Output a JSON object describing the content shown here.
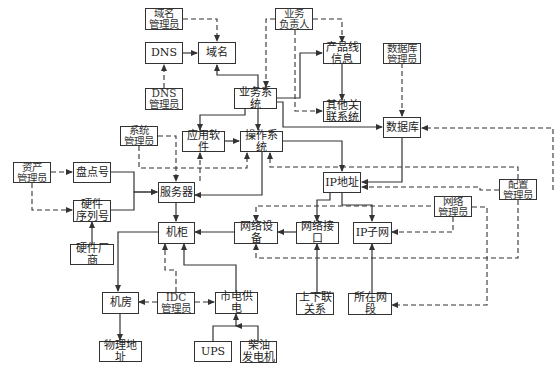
{
  "diagram": {
    "title": "",
    "nodes": [
      {
        "id": "dns",
        "label": "DNS",
        "x": 145,
        "y": 42,
        "w": 38,
        "h": 22,
        "role": "entity"
      },
      {
        "id": "domain",
        "label": "域名",
        "x": 198,
        "y": 42,
        "w": 38,
        "h": 22,
        "role": "entity"
      },
      {
        "id": "domain_admin",
        "label": "域名\n管理员",
        "x": 145,
        "y": 8,
        "w": 38,
        "h": 22,
        "role": "manager"
      },
      {
        "id": "dns_admin",
        "label": "DNS\n管理员",
        "x": 145,
        "y": 88,
        "w": 38,
        "h": 22,
        "role": "manager"
      },
      {
        "id": "biz_owner",
        "label": "业务\n负责人",
        "x": 275,
        "y": 8,
        "w": 38,
        "h": 22,
        "role": "manager"
      },
      {
        "id": "product_line",
        "label": "产品线\n信息",
        "x": 323,
        "y": 43,
        "w": 38,
        "h": 20,
        "role": "entity"
      },
      {
        "id": "other_sys",
        "label": "其他关\n联系统",
        "x": 323,
        "y": 101,
        "w": 38,
        "h": 20,
        "role": "entity"
      },
      {
        "id": "db_admin",
        "label": "数据库\n管理员",
        "x": 383,
        "y": 43,
        "w": 38,
        "h": 20,
        "role": "manager"
      },
      {
        "id": "biz_system",
        "label": "业务系统",
        "x": 234,
        "y": 88,
        "w": 43,
        "h": 21,
        "role": "entity"
      },
      {
        "id": "database",
        "label": "数据库",
        "x": 383,
        "y": 117,
        "w": 38,
        "h": 21,
        "role": "entity"
      },
      {
        "id": "sys_admin",
        "label": "系统\n管理员",
        "x": 120,
        "y": 126,
        "w": 38,
        "h": 20,
        "role": "manager"
      },
      {
        "id": "app_software",
        "label": "应用软件",
        "x": 182,
        "y": 131,
        "w": 43,
        "h": 21,
        "role": "entity"
      },
      {
        "id": "os",
        "label": "操作系统",
        "x": 240,
        "y": 131,
        "w": 43,
        "h": 21,
        "role": "entity"
      },
      {
        "id": "asset_admin",
        "label": "资产\n管理员",
        "x": 13,
        "y": 162,
        "w": 38,
        "h": 21,
        "role": "manager"
      },
      {
        "id": "inventory_no",
        "label": "盘点号",
        "x": 73,
        "y": 162,
        "w": 38,
        "h": 21,
        "role": "entity"
      },
      {
        "id": "ip_address",
        "label": "IP地址",
        "x": 323,
        "y": 172,
        "w": 38,
        "h": 21,
        "role": "entity"
      },
      {
        "id": "config_admin",
        "label": "配置\n管理员",
        "x": 499,
        "y": 179,
        "w": 38,
        "h": 21,
        "role": "manager"
      },
      {
        "id": "server",
        "label": "服务器",
        "x": 158,
        "y": 182,
        "w": 36,
        "h": 21,
        "role": "entity"
      },
      {
        "id": "hw_serial",
        "label": "硬件\n序列号",
        "x": 73,
        "y": 200,
        "w": 38,
        "h": 21,
        "role": "entity"
      },
      {
        "id": "net_admin",
        "label": "网络\n管理员",
        "x": 434,
        "y": 196,
        "w": 38,
        "h": 21,
        "role": "manager"
      },
      {
        "id": "rack",
        "label": "机柜",
        "x": 158,
        "y": 222,
        "w": 36,
        "h": 21,
        "role": "entity"
      },
      {
        "id": "net_device",
        "label": "网络设备",
        "x": 234,
        "y": 222,
        "w": 43,
        "h": 21,
        "role": "entity"
      },
      {
        "id": "net_port",
        "label": "网络接口",
        "x": 296,
        "y": 222,
        "w": 43,
        "h": 21,
        "role": "entity"
      },
      {
        "id": "ip_subnet",
        "label": "IP子网",
        "x": 353,
        "y": 222,
        "w": 38,
        "h": 21,
        "role": "entity"
      },
      {
        "id": "hw_vendor",
        "label": "硬件厂商",
        "x": 70,
        "y": 244,
        "w": 44,
        "h": 21,
        "role": "entity"
      },
      {
        "id": "uplink",
        "label": "上下联\n关系",
        "x": 296,
        "y": 293,
        "w": 38,
        "h": 22,
        "role": "entity"
      },
      {
        "id": "net_segment",
        "label": "所在网段",
        "x": 348,
        "y": 293,
        "w": 43,
        "h": 22,
        "role": "entity"
      },
      {
        "id": "machine_room",
        "label": "机房",
        "x": 102,
        "y": 292,
        "w": 36,
        "h": 21,
        "role": "entity"
      },
      {
        "id": "idc_admin",
        "label": "IDC\n管理员",
        "x": 157,
        "y": 292,
        "w": 38,
        "h": 21,
        "role": "manager"
      },
      {
        "id": "city_power",
        "label": "市电供电",
        "x": 215,
        "y": 292,
        "w": 43,
        "h": 21,
        "role": "entity"
      },
      {
        "id": "physical_addr",
        "label": "物理地址",
        "x": 99,
        "y": 341,
        "w": 43,
        "h": 21,
        "role": "entity"
      },
      {
        "id": "ups",
        "label": "UPS",
        "x": 194,
        "y": 341,
        "w": 38,
        "h": 21,
        "role": "entity"
      },
      {
        "id": "diesel_gen",
        "label": "柴油\n发电机",
        "x": 240,
        "y": 341,
        "w": 37,
        "h": 21,
        "role": "entity"
      }
    ],
    "edges": [
      {
        "from": "dns",
        "to": "domain",
        "style": "solid"
      },
      {
        "from": "domain_admin",
        "to": "domain",
        "style": "dashed"
      },
      {
        "from": "dns_admin",
        "to": "dns",
        "style": "dashed"
      },
      {
        "from": "biz_system",
        "to": "domain",
        "style": "solid"
      },
      {
        "from": "biz_owner",
        "to": "biz_system",
        "style": "dashed"
      },
      {
        "from": "biz_owner",
        "to": "product_line",
        "style": "dashed"
      },
      {
        "from": "biz_owner",
        "to": "other_sys",
        "style": "dashed"
      },
      {
        "from": "biz_system",
        "to": "product_line",
        "style": "solid"
      },
      {
        "from": "product_line",
        "to": "other_sys",
        "style": "solid"
      },
      {
        "from": "biz_system",
        "to": "database",
        "style": "solid"
      },
      {
        "from": "db_admin",
        "to": "database",
        "style": "dashed"
      },
      {
        "from": "biz_system",
        "to": "app_software",
        "style": "solid"
      },
      {
        "from": "biz_system",
        "to": "os",
        "style": "solid"
      },
      {
        "from": "app_software",
        "to": "os",
        "style": "solid"
      },
      {
        "from": "os",
        "to": "server",
        "style": "solid"
      },
      {
        "from": "os",
        "to": "ip_address",
        "style": "solid"
      },
      {
        "from": "database",
        "to": "ip_address",
        "style": "solid"
      },
      {
        "from": "sys_admin",
        "to": "server",
        "style": "dashed"
      },
      {
        "from": "sys_admin",
        "to": "os",
        "style": "dashed"
      },
      {
        "from": "sys_admin",
        "to": "app_software",
        "style": "dashed"
      },
      {
        "from": "asset_admin",
        "to": "inventory_no",
        "style": "dashed"
      },
      {
        "from": "asset_admin",
        "to": "hw_serial",
        "style": "dashed"
      },
      {
        "from": "inventory_no",
        "to": "server",
        "style": "solid"
      },
      {
        "from": "hw_serial",
        "to": "server",
        "style": "solid"
      },
      {
        "from": "hw_vendor",
        "to": "hw_serial",
        "style": "solid"
      },
      {
        "from": "server",
        "to": "rack",
        "style": "solid"
      },
      {
        "from": "config_admin",
        "to": "database",
        "style": "dashed"
      },
      {
        "from": "config_admin",
        "to": "ip_address",
        "style": "dashed"
      },
      {
        "from": "config_admin",
        "to": "os",
        "style": "dashed"
      },
      {
        "from": "config_admin",
        "to": "net_device",
        "style": "dashed"
      },
      {
        "from": "net_admin",
        "to": "ip_subnet",
        "style": "dashed"
      },
      {
        "from": "net_admin",
        "to": "net_segment",
        "style": "dashed"
      },
      {
        "from": "net_admin",
        "to": "net_device",
        "style": "dashed"
      },
      {
        "from": "ip_address",
        "to": "net_port",
        "style": "solid"
      },
      {
        "from": "ip_address",
        "to": "ip_subnet",
        "style": "solid"
      },
      {
        "from": "net_port",
        "to": "net_device",
        "style": "solid"
      },
      {
        "from": "net_device",
        "to": "rack",
        "style": "solid"
      },
      {
        "from": "uplink",
        "to": "net_port",
        "style": "solid"
      },
      {
        "from": "net_segment",
        "to": "ip_subnet",
        "style": "solid"
      },
      {
        "from": "rack",
        "to": "machine_room",
        "style": "solid"
      },
      {
        "from": "idc_admin",
        "to": "rack",
        "style": "dashed"
      },
      {
        "from": "idc_admin",
        "to": "machine_room",
        "style": "dashed"
      },
      {
        "from": "idc_admin",
        "to": "city_power",
        "style": "dashed"
      },
      {
        "from": "city_power",
        "to": "rack",
        "style": "solid"
      },
      {
        "from": "machine_room",
        "to": "physical_addr",
        "style": "solid"
      },
      {
        "from": "ups",
        "to": "city_power",
        "style": "solid"
      },
      {
        "from": "diesel_gen",
        "to": "city_power",
        "style": "solid"
      }
    ]
  },
  "labels": {
    "dns": "DNS",
    "domain": "域名",
    "domain_admin": "域名\n管理员",
    "dns_admin": "DNS\n管理员",
    "biz_owner": "业务\n负责人",
    "product_line": "产品线\n信息",
    "other_sys": "其他关\n联系统",
    "db_admin": "数据库\n管理员",
    "biz_system": "业务系统",
    "database": "数据库",
    "sys_admin": "系统\n管理员",
    "app_software": "应用软件",
    "os": "操作系统",
    "asset_admin": "资产\n管理员",
    "inventory_no": "盘点号",
    "ip_address": "IP地址",
    "config_admin": "配置\n管理员",
    "server": "服务器",
    "hw_serial": "硬件\n序列号",
    "net_admin": "网络\n管理员",
    "rack": "机柜",
    "net_device": "网络设备",
    "net_port": "网络接口",
    "ip_subnet": "IP子网",
    "hw_vendor": "硬件厂商",
    "uplink": "上下联\n关系",
    "net_segment": "所在网段",
    "machine_room": "机房",
    "idc_admin": "IDC\n管理员",
    "city_power": "市电供电",
    "physical_addr": "物理地址",
    "ups": "UPS",
    "diesel_gen": "柴油\n发电机"
  },
  "colors": {
    "line": "#333333",
    "background": "#ffffff"
  }
}
